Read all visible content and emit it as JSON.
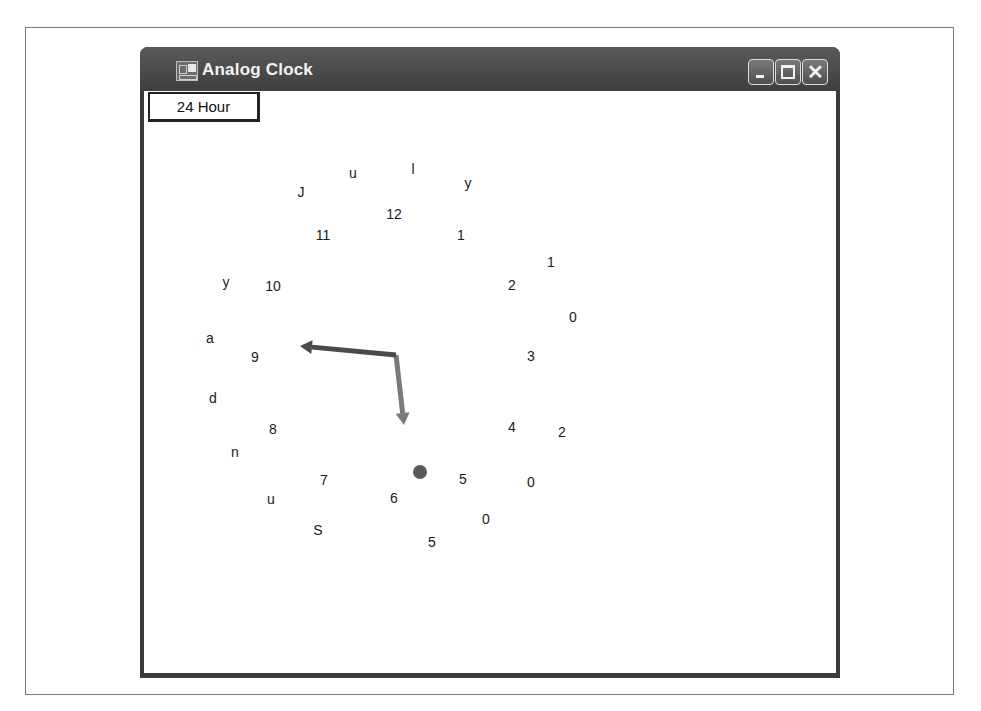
{
  "window": {
    "title": "Analog Clock",
    "icon": "app-window-icon",
    "controls": {
      "minimize": "minimize-icon",
      "maximize": "maximize-icon",
      "close": "close-icon",
      "close_glyph": "✕"
    }
  },
  "toolbar": {
    "mode_button_label": "24 Hour"
  },
  "clock": {
    "hour_numerals": [
      {
        "text": "12",
        "x": 394,
        "y": 214
      },
      {
        "text": "1",
        "x": 461,
        "y": 235
      },
      {
        "text": "2",
        "x": 512,
        "y": 285
      },
      {
        "text": "3",
        "x": 531,
        "y": 356
      },
      {
        "text": "4",
        "x": 512,
        "y": 427
      },
      {
        "text": "5",
        "x": 463,
        "y": 479
      },
      {
        "text": "6",
        "x": 394,
        "y": 498
      },
      {
        "text": "7",
        "x": 324,
        "y": 480
      },
      {
        "text": "8",
        "x": 273,
        "y": 429
      },
      {
        "text": "9",
        "x": 255,
        "y": 357
      },
      {
        "text": "10",
        "x": 273,
        "y": 286
      },
      {
        "text": "11",
        "x": 323,
        "y": 235
      }
    ],
    "date_ring_text": "July 10, 2005 Sunday",
    "date_ring_letters": [
      {
        "text": "J",
        "x": 301,
        "y": 192
      },
      {
        "text": "u",
        "x": 353,
        "y": 173
      },
      {
        "text": "l",
        "x": 413,
        "y": 169
      },
      {
        "text": "y",
        "x": 468,
        "y": 183
      },
      {
        "text": "1",
        "x": 551,
        "y": 262
      },
      {
        "text": "0",
        "x": 573,
        "y": 317
      },
      {
        "text": "2",
        "x": 562,
        "y": 432
      },
      {
        "text": "0",
        "x": 531,
        "y": 482
      },
      {
        "text": "0",
        "x": 486,
        "y": 519
      },
      {
        "text": "5",
        "x": 432,
        "y": 542
      },
      {
        "text": "S",
        "x": 318,
        "y": 530
      },
      {
        "text": "u",
        "x": 271,
        "y": 499
      },
      {
        "text": "n",
        "x": 235,
        "y": 452
      },
      {
        "text": "d",
        "x": 213,
        "y": 398
      },
      {
        "text": "a",
        "x": 210,
        "y": 338
      },
      {
        "text": "y",
        "x": 226,
        "y": 282
      }
    ],
    "pivot": {
      "x": 396,
      "y": 355
    },
    "hour_hand_tip": {
      "x": 404,
      "y": 425
    },
    "minute_hand_tip": {
      "x": 300,
      "y": 346
    },
    "second_dot": {
      "x": 420,
      "y": 472,
      "r": 7
    },
    "colors": {
      "minute_hand": "#4a4a4a",
      "hour_hand": "#7a7a7a",
      "second_dot": "#5a5a5a"
    }
  }
}
